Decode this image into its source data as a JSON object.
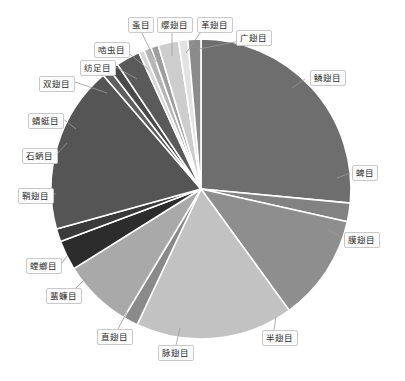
{
  "chart_data": {
    "type": "pie",
    "title": "",
    "subtitle": "",
    "xlabel": "",
    "ylabel": "",
    "legend_position": "none",
    "grid": false,
    "label_style": "callout-boxes-with-leader-lines",
    "start_angle_deg": 0,
    "direction": "clockwise",
    "center_px": [
      201,
      189
    ],
    "radius_px": 150,
    "categories": [
      "鳞翅目",
      "蜱目",
      "膜翅目",
      "半翅目",
      "脉翅目",
      "直翅目",
      "蜚蠊目",
      "螳螂目",
      "鞘翅目",
      "石蛃目",
      "蜻蜓目",
      "双翅目",
      "纺足目",
      "啮虫目",
      "蚤目",
      "缨翅目",
      "革翅目",
      "广翅目"
    ],
    "values": [
      26.5,
      2.0,
      11.5,
      17.0,
      1.6,
      7.5,
      3.2,
      1.4,
      18.0,
      0.9,
      1.0,
      2.6,
      0.6,
      0.8,
      0.8,
      2.2,
      1.0,
      1.4
    ],
    "unit": "percent",
    "colors": [
      "#6e6e6e",
      "#828282",
      "#8e8e8e",
      "#c2c2c2",
      "#8a8a8a",
      "#a9a9a9",
      "#2c2c2c",
      "#3a3a3a",
      "#555555",
      "#5f5f5f",
      "#4a4a4a",
      "#5a5a5a",
      "#d6d6d6",
      "#b5b5b5",
      "#9e9e9e",
      "#cdcdcd",
      "#e2e2e2",
      "#8b8b8b"
    ],
    "labels": [
      {
        "text": "鳞翅目",
        "x": 310,
        "y": 70,
        "anchor_x": 305,
        "anchor_y": 79,
        "point_x": 292,
        "point_y": 88
      },
      {
        "text": "蜱目",
        "x": 352,
        "y": 165,
        "anchor_x": 350,
        "anchor_y": 173,
        "point_x": 337,
        "point_y": 178
      },
      {
        "text": "膜翅目",
        "x": 344,
        "y": 232,
        "anchor_x": 342,
        "anchor_y": 238,
        "point_x": 327,
        "point_y": 229
      },
      {
        "text": "半翅目",
        "x": 262,
        "y": 330,
        "anchor_x": 274,
        "anchor_y": 330,
        "point_x": 276,
        "point_y": 317
      },
      {
        "text": "脉翅目",
        "x": 158,
        "y": 345,
        "anchor_x": 176,
        "anchor_y": 345,
        "point_x": 180,
        "point_y": 328
      },
      {
        "text": "直翅目",
        "x": 97,
        "y": 329,
        "anchor_x": 118,
        "anchor_y": 329,
        "point_x": 127,
        "point_y": 312
      },
      {
        "text": "蜚蠊目",
        "x": 46,
        "y": 288,
        "anchor_x": 73,
        "anchor_y": 291,
        "point_x": 85,
        "point_y": 279
      },
      {
        "text": "螳螂目",
        "x": 26,
        "y": 258,
        "anchor_x": 62,
        "anchor_y": 263,
        "point_x": 67,
        "point_y": 256
      },
      {
        "text": "鞘翅目",
        "x": 18,
        "y": 188,
        "anchor_x": 53,
        "anchor_y": 194,
        "point_x": 56,
        "point_y": 194
      },
      {
        "text": "石蛃目",
        "x": 22,
        "y": 148,
        "anchor_x": 57,
        "anchor_y": 154,
        "point_x": 67,
        "point_y": 143
      },
      {
        "text": "蜻蜓目",
        "x": 28,
        "y": 113,
        "anchor_x": 63,
        "anchor_y": 119,
        "point_x": 76,
        "point_y": 129
      },
      {
        "text": "双翅目",
        "x": 39,
        "y": 76,
        "anchor_x": 75,
        "anchor_y": 82,
        "point_x": 107,
        "point_y": 93
      },
      {
        "text": "纺足目",
        "x": 80,
        "y": 60,
        "anchor_x": 114,
        "anchor_y": 66,
        "point_x": 137,
        "point_y": 79
      },
      {
        "text": "啮虫目",
        "x": 94,
        "y": 42,
        "anchor_x": 126,
        "anchor_y": 51,
        "point_x": 148,
        "point_y": 69
      },
      {
        "text": "蚤目",
        "x": 128,
        "y": 17,
        "anchor_x": 140,
        "anchor_y": 29,
        "point_x": 156,
        "point_y": 62
      },
      {
        "text": "缨翅目",
        "x": 157,
        "y": 17,
        "anchor_x": 172,
        "anchor_y": 29,
        "point_x": 172,
        "point_y": 56
      },
      {
        "text": "革翅目",
        "x": 197,
        "y": 17,
        "anchor_x": 203,
        "anchor_y": 29,
        "point_x": 186,
        "point_y": 53
      },
      {
        "text": "广翅目",
        "x": 236,
        "y": 30,
        "anchor_x": 240,
        "anchor_y": 41,
        "point_x": 199,
        "point_y": 49
      }
    ]
  }
}
